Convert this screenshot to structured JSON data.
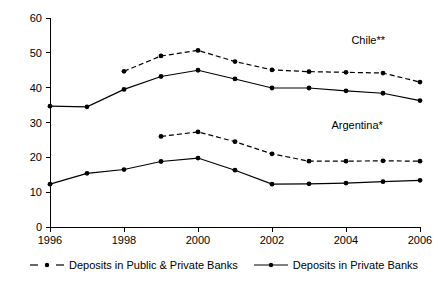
{
  "chart_data": {
    "type": "line",
    "title": "",
    "subtitle": "",
    "xlabel": "",
    "ylabel": "",
    "xlim": [
      1996,
      2006
    ],
    "ylim": [
      0,
      60
    ],
    "grid": false,
    "legend_position": "bottom",
    "x": [
      1996,
      1997,
      1998,
      1999,
      2000,
      2001,
      2002,
      2003,
      2004,
      2005,
      2006
    ],
    "x_tick_labels": [
      "1996",
      "1998",
      "2000",
      "2002",
      "2004",
      "2006"
    ],
    "x_ticks": [
      1996,
      1998,
      2000,
      2002,
      2004,
      2006
    ],
    "y_ticks": [
      0,
      10,
      20,
      30,
      40,
      50,
      60
    ],
    "y_tick_labels": [
      "0",
      "10",
      "20",
      "30",
      "40",
      "50",
      "60"
    ],
    "series": [
      {
        "name": "Chile** - Deposits in Public & Private Banks",
        "group": "Chile**",
        "style": "dashed",
        "x": [
          1998,
          1999,
          2000,
          2001,
          2002,
          2003,
          2004,
          2005,
          2006
        ],
        "values": [
          44.7,
          49.1,
          50.7,
          47.5,
          45.1,
          44.6,
          44.4,
          44.2,
          41.6
        ]
      },
      {
        "name": "Chile** - Deposits in Private Banks",
        "group": "Chile**",
        "style": "solid",
        "x": [
          1996,
          1997,
          1998,
          1999,
          2000,
          2001,
          2002,
          2003,
          2004,
          2005,
          2006
        ],
        "values": [
          34.7,
          34.5,
          39.5,
          43.2,
          45.0,
          42.5,
          39.9,
          39.9,
          39.1,
          38.4,
          36.3
        ]
      },
      {
        "name": "Argentina* - Deposits in Public & Private Banks",
        "group": "Argentina*",
        "style": "dashed",
        "x": [
          1999,
          2000,
          2001,
          2002,
          2003,
          2004,
          2005,
          2006
        ],
        "values": [
          26.0,
          27.3,
          24.5,
          21.0,
          18.9,
          18.9,
          19.0,
          18.9
        ]
      },
      {
        "name": "Argentina* - Deposits in Private Banks",
        "group": "Argentina*",
        "style": "solid",
        "x": [
          1996,
          1997,
          1998,
          1999,
          2000,
          2001,
          2002,
          2003,
          2004,
          2005,
          2006
        ],
        "values": [
          12.3,
          15.4,
          16.5,
          18.8,
          19.8,
          16.3,
          12.3,
          12.4,
          12.6,
          13.0,
          13.4
        ]
      }
    ],
    "annotations": [
      {
        "text": "Chile**",
        "x": 2004.6,
        "y": 52.6
      },
      {
        "text": "Argentina*",
        "x": 2004.3,
        "y": 28.1
      }
    ],
    "legend": [
      {
        "label": "Deposits in Public & Private Banks",
        "style": "dashed"
      },
      {
        "label": "Deposits in Private Banks",
        "style": "solid"
      }
    ]
  }
}
